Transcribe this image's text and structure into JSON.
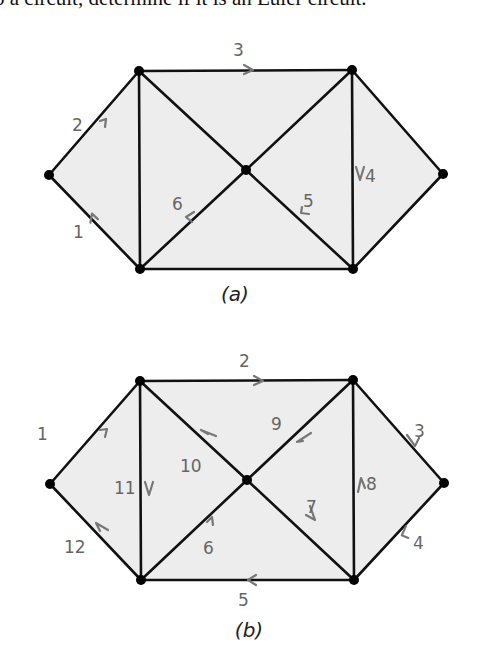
{
  "header": {
    "text": "o a circuit, determine if it is an Euler circuit."
  },
  "diagrams": [
    {
      "caption": "(a)",
      "edge_labels": [
        "1",
        "2",
        "3",
        "4",
        "5",
        "6"
      ]
    },
    {
      "caption": "(b)",
      "edge_labels": [
        "1",
        "2",
        "3",
        "4",
        "5",
        "6",
        "7",
        "8",
        "9",
        "10",
        "11",
        "12"
      ]
    }
  ],
  "colors": {
    "edge": "#111111",
    "arrow": "#777777",
    "label": "#666666",
    "fill": "#ededed"
  }
}
